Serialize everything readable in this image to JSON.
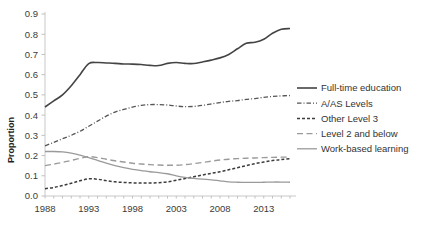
{
  "chart_data": {
    "type": "line",
    "title": "",
    "xlabel": "",
    "ylabel": "Proportion",
    "xlim": [
      1988,
      2016
    ],
    "ylim": [
      0.0,
      0.9
    ],
    "grid": false,
    "legend_position": "right",
    "x_tick_labels": [
      "1988",
      "1993",
      "1998",
      "2003",
      "2008",
      "2013"
    ],
    "x_ticks": [
      1988,
      1993,
      1998,
      2003,
      2008,
      2013
    ],
    "y_tick_labels": [
      "0.0",
      "0.1",
      "0.2",
      "0.3",
      "0.4",
      "0.5",
      "0.6",
      "0.7",
      "0.8",
      "0.9"
    ],
    "y_ticks": [
      0.0,
      0.1,
      0.2,
      0.3,
      0.4,
      0.5,
      0.6,
      0.7,
      0.8,
      0.9
    ],
    "x": [
      1988,
      1989,
      1990,
      1991,
      1992,
      1993,
      1994,
      1995,
      1996,
      1997,
      1998,
      1999,
      2000,
      2001,
      2002,
      2003,
      2004,
      2005,
      2006,
      2007,
      2008,
      2009,
      2010,
      2011,
      2012,
      2013,
      2014,
      2015,
      2016
    ],
    "series": [
      {
        "name": "Full-time education",
        "color": "#444444",
        "dash": "solid",
        "width": 1.6,
        "values": [
          0.44,
          0.47,
          0.5,
          0.545,
          0.6,
          0.655,
          0.66,
          0.658,
          0.656,
          0.653,
          0.652,
          0.65,
          0.646,
          0.645,
          0.656,
          0.66,
          0.656,
          0.655,
          0.663,
          0.672,
          0.683,
          0.7,
          0.728,
          0.755,
          0.76,
          0.775,
          0.805,
          0.825,
          0.828
        ]
      },
      {
        "name": "A/AS Levels",
        "color": "#555555",
        "dash": "dashdot",
        "width": 1.3,
        "values": [
          0.248,
          0.265,
          0.283,
          0.3,
          0.32,
          0.345,
          0.37,
          0.395,
          0.415,
          0.428,
          0.44,
          0.448,
          0.452,
          0.452,
          0.45,
          0.445,
          0.442,
          0.443,
          0.448,
          0.455,
          0.462,
          0.468,
          0.472,
          0.478,
          0.482,
          0.488,
          0.492,
          0.495,
          0.497
        ]
      },
      {
        "name": "Other Level 3",
        "color": "#3c3c3c",
        "dash": "dashed-short",
        "width": 1.5,
        "values": [
          0.036,
          0.042,
          0.052,
          0.063,
          0.075,
          0.085,
          0.083,
          0.076,
          0.07,
          0.067,
          0.065,
          0.064,
          0.064,
          0.066,
          0.07,
          0.078,
          0.086,
          0.095,
          0.104,
          0.112,
          0.12,
          0.13,
          0.14,
          0.15,
          0.16,
          0.168,
          0.175,
          0.18,
          0.184
        ]
      },
      {
        "name": "Level 2 and below",
        "color": "#9a9a9a",
        "dash": "dashed-long",
        "width": 1.4,
        "values": [
          0.15,
          0.158,
          0.166,
          0.176,
          0.186,
          0.194,
          0.19,
          0.182,
          0.174,
          0.168,
          0.162,
          0.158,
          0.155,
          0.153,
          0.152,
          0.152,
          0.155,
          0.16,
          0.166,
          0.172,
          0.178,
          0.182,
          0.185,
          0.187,
          0.188,
          0.19,
          0.191,
          0.192,
          0.192
        ]
      },
      {
        "name": "Work-based learning",
        "color": "#9a9a9a",
        "dash": "solid",
        "width": 1.3,
        "values": [
          0.22,
          0.22,
          0.218,
          0.212,
          0.202,
          0.19,
          0.176,
          0.162,
          0.15,
          0.14,
          0.132,
          0.126,
          0.12,
          0.116,
          0.11,
          0.1,
          0.092,
          0.087,
          0.083,
          0.08,
          0.075,
          0.07,
          0.068,
          0.067,
          0.067,
          0.068,
          0.069,
          0.069,
          0.068
        ]
      }
    ]
  },
  "legend": {
    "items": [
      {
        "label": "Full-time education"
      },
      {
        "label": "A/AS Levels"
      },
      {
        "label": "Other Level 3"
      },
      {
        "label": "Level 2 and below"
      },
      {
        "label": "Work-based learning"
      }
    ]
  }
}
